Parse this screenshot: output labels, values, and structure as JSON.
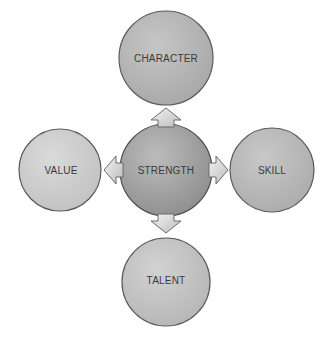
{
  "diagram": {
    "center": {
      "label": "STRENGTH",
      "fill": "#9a9a9a"
    },
    "nodes": [
      {
        "id": "top",
        "label": "CHARACTER",
        "fill": "#b4b4b4"
      },
      {
        "id": "left",
        "label": "VALUE",
        "fill": "#cdcdcd"
      },
      {
        "id": "right",
        "label": "SKILL",
        "fill": "#b9b9b9"
      },
      {
        "id": "bottom",
        "label": "TALENT",
        "fill": "#c4c4c4"
      }
    ],
    "arrows": [
      "up",
      "left",
      "right",
      "down"
    ],
    "stroke": "#5a5a5a"
  }
}
